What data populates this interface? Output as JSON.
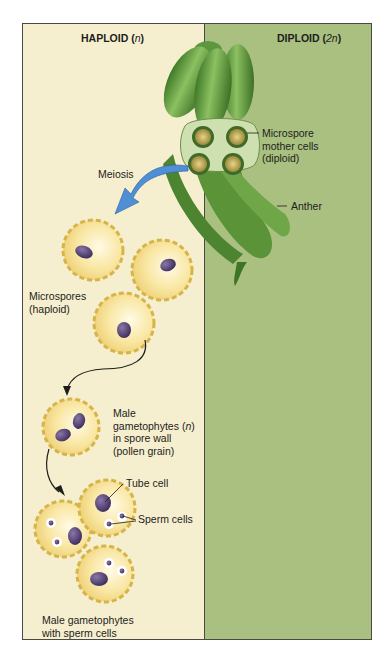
{
  "figure": {
    "title_regions": {
      "haploid": {
        "label": "HAPLOID",
        "ploidy": "n"
      },
      "diploid": {
        "label": "DIPLOID",
        "ploidy": "2n"
      }
    },
    "labels": {
      "microspore_mother_cells": [
        "Microspore",
        "mother cells",
        "(diploid)"
      ],
      "anther": "Anther",
      "meiosis": "Meiosis",
      "microspores": [
        "Microspores",
        "(haploid)"
      ],
      "male_gametophytes_in_wall": [
        "Male",
        "gametophytes (",
        "n",
        ")",
        "in spore wall",
        "(pollen grain)"
      ],
      "tube_cell": "Tube cell",
      "sperm_cells": "Sperm cells",
      "male_gametophytes_sperm": [
        "Male gametophytes",
        "with sperm cells"
      ]
    },
    "colors": {
      "haploid_bg": "#f6efcf",
      "diploid_bg": "#a9c081",
      "anther_green": "#5f9a3c",
      "pollen_wall": "#e6c35a",
      "nucleus": "#4e3d6b",
      "meiosis_arrow": "#4f8fd6"
    }
  }
}
